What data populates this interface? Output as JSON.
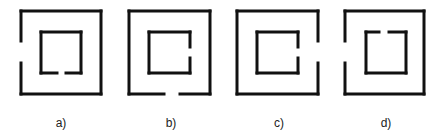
{
  "figure": {
    "stroke_color": "#111111",
    "stroke_width": 3,
    "panels": [
      {
        "label": "a)",
        "label_x": 61,
        "outer": {
          "x1": 21,
          "y1": 11,
          "x2": 101,
          "y2": 94,
          "gap_side": "left",
          "gap_from": 41,
          "gap_to": 63
        },
        "inner": {
          "x1": 41,
          "y1": 32,
          "x2": 81,
          "y2": 73,
          "gap_side": "bottom",
          "gap_from": 57,
          "gap_to": 66
        }
      },
      {
        "label": "b)",
        "label_x": 171,
        "outer": {
          "x1": 129,
          "y1": 11,
          "x2": 210,
          "y2": 94,
          "gap_side": "bottom",
          "gap_from": 164,
          "gap_to": 180
        },
        "inner": {
          "x1": 149,
          "y1": 32,
          "x2": 190,
          "y2": 73,
          "gap_side": "right",
          "gap_from": 47,
          "gap_to": 58
        }
      },
      {
        "label": "c)",
        "label_x": 279,
        "outer": {
          "x1": 237,
          "y1": 11,
          "x2": 318,
          "y2": 94,
          "gap_side": "right",
          "gap_from": 41,
          "gap_to": 63
        },
        "inner": {
          "x1": 257,
          "y1": 32,
          "x2": 298,
          "y2": 73,
          "gap_side": "right",
          "gap_from": 47,
          "gap_to": 58
        }
      },
      {
        "label": "d)",
        "label_x": 386,
        "outer": {
          "x1": 345,
          "y1": 11,
          "x2": 424,
          "y2": 94,
          "gap_side": "left",
          "gap_from": 41,
          "gap_to": 63
        },
        "inner": {
          "x1": 366,
          "y1": 32,
          "x2": 406,
          "y2": 73,
          "gap_side": "top",
          "gap_from": 379,
          "gap_to": 389
        }
      }
    ]
  }
}
